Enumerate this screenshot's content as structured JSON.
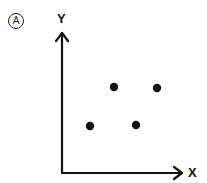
{
  "panel_label": "A",
  "chart_data": {
    "type": "scatter",
    "title": "",
    "xlabel": "X",
    "ylabel": "Y",
    "grid": false,
    "legend": null,
    "points": [
      {
        "x": 0.2,
        "y": 0.35
      },
      {
        "x": 0.38,
        "y": 0.64
      },
      {
        "x": 0.56,
        "y": 0.36
      },
      {
        "x": 0.73,
        "y": 0.63
      }
    ],
    "pixel_points": [
      [
        90,
        126
      ],
      [
        114,
        87
      ],
      [
        136,
        125
      ],
      [
        157,
        88
      ]
    ],
    "colors": {
      "axis": "#111111",
      "points": "#111111"
    }
  }
}
